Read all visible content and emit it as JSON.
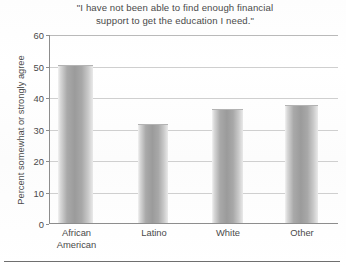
{
  "chart_data": {
    "type": "bar",
    "title": "\"I have not been able to find enough financial support to get the education I need.\"",
    "title_lines": [
      "\"I have not been able to find enough financial",
      "support to get the education I need.\""
    ],
    "xlabel": "",
    "ylabel": "Percent somewhat or strongly agree",
    "categories": [
      "African American",
      "Latino",
      "White",
      "Other"
    ],
    "category_lines": [
      [
        "African",
        "American"
      ],
      [
        "Latino",
        ""
      ],
      [
        "White",
        ""
      ],
      [
        "Other",
        ""
      ]
    ],
    "values": [
      50,
      31,
      36,
      37
    ],
    "ylim": [
      0,
      60
    ],
    "yticks": [
      0,
      10,
      20,
      30,
      40,
      50,
      60
    ],
    "ytick_labels": [
      "0",
      "10",
      "20",
      "30",
      "40",
      "50",
      "60"
    ],
    "grid": true,
    "legend": false,
    "bar_color": "#9b9b9b",
    "gridline_color": "#cfcfcf",
    "axis_color": "#8d8d8d",
    "text_color": "#4a4a4a"
  }
}
